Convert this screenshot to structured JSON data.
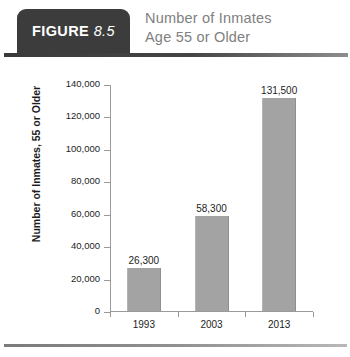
{
  "header": {
    "badge_figure_word": "FIGURE",
    "badge_figure_number": "8.5",
    "title_line1": "Number of Inmates",
    "title_line2": "Age 55 or Older",
    "badge_color": "#3c3c3c",
    "title_color": "#808080",
    "rule_color": "#3a3a3a"
  },
  "chart_data": {
    "type": "bar",
    "title": "Number of Inmates Age 55 or Older",
    "categories": [
      "1993",
      "2003",
      "2013"
    ],
    "values": [
      26300,
      58300,
      131500
    ],
    "value_labels": [
      "26,300",
      "58,300",
      "131,500"
    ],
    "xlabel": "",
    "ylabel": "Number of Inmates, 55 or Older",
    "ylim": [
      0,
      140000
    ],
    "ytick_step": 20000,
    "yticks": [
      0,
      20000,
      40000,
      60000,
      80000,
      100000,
      120000,
      140000
    ],
    "ytick_labels": [
      "0",
      "20,000",
      "40,000",
      "60,000",
      "80,000",
      "100,000",
      "120,000",
      "140,000"
    ],
    "grid": false,
    "legend": false,
    "bar_color": "#a3a3a3",
    "axis_color": "#9a9a9a",
    "text_color": "#1d1d1d"
  }
}
